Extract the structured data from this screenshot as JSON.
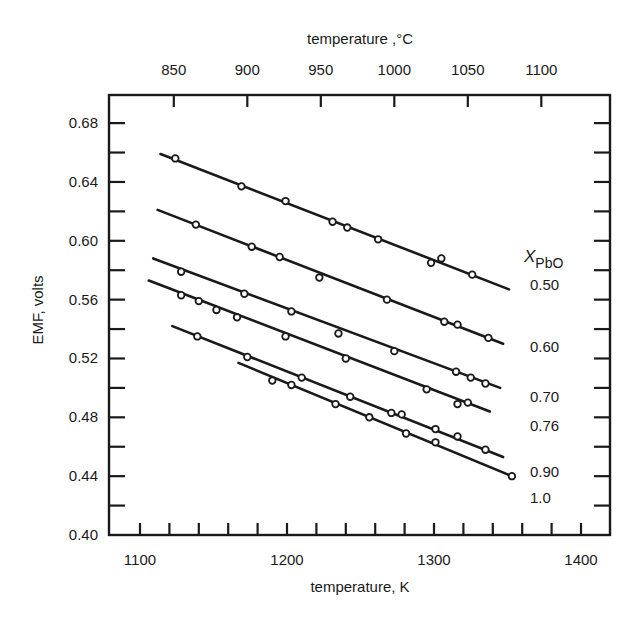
{
  "chart_data": {
    "type": "line",
    "title": "",
    "xlabel": "temperature, K",
    "x2label": "temperature ,°C",
    "ylabel": "EMF, volts",
    "xlim": [
      1075,
      1415
    ],
    "ylim": [
      0.4,
      0.7
    ],
    "x_ticks": [
      1100,
      1200,
      1300,
      1400
    ],
    "x_minor_step": 20,
    "x2_ticks": [
      850,
      900,
      950,
      1000,
      1050,
      1100
    ],
    "y_ticks": [
      0.4,
      0.44,
      0.48,
      0.52,
      0.56,
      0.6,
      0.64,
      0.68
    ],
    "y_minor_step": 0.02,
    "grid": false,
    "legend_title": "X",
    "legend_title_sub": "PbO",
    "legend_position": "right, labels next to line ends",
    "series": [
      {
        "name": "0.50",
        "label_y": 0.57,
        "fit": [
          [
            1114,
            0.659
          ],
          [
            1351,
            0.567
          ]
        ],
        "points": [
          [
            1124,
            0.656
          ],
          [
            1169,
            0.637
          ],
          [
            1199,
            0.627
          ],
          [
            1231,
            0.613
          ],
          [
            1241,
            0.609
          ],
          [
            1262,
            0.601
          ],
          [
            1298,
            0.585
          ],
          [
            1305,
            0.588
          ],
          [
            1326,
            0.577
          ]
        ]
      },
      {
        "name": "0.60",
        "label_y": 0.528,
        "fit": [
          [
            1112,
            0.621
          ],
          [
            1347,
            0.53
          ]
        ],
        "points": [
          [
            1138,
            0.611
          ],
          [
            1176,
            0.596
          ],
          [
            1195,
            0.589
          ],
          [
            1222,
            0.575
          ],
          [
            1268,
            0.56
          ],
          [
            1307,
            0.545
          ],
          [
            1316,
            0.543
          ],
          [
            1337,
            0.534
          ]
        ]
      },
      {
        "name": "0.70",
        "label_y": 0.494,
        "fit": [
          [
            1109,
            0.588
          ],
          [
            1345,
            0.5
          ]
        ],
        "points": [
          [
            1128,
            0.579
          ],
          [
            1171,
            0.564
          ],
          [
            1203,
            0.552
          ],
          [
            1235,
            0.537
          ],
          [
            1273,
            0.525
          ],
          [
            1315,
            0.511
          ],
          [
            1325,
            0.507
          ],
          [
            1335,
            0.503
          ]
        ]
      },
      {
        "name": "0.76",
        "label_y": 0.474,
        "fit": [
          [
            1106,
            0.573
          ],
          [
            1338,
            0.484
          ]
        ],
        "points": [
          [
            1128,
            0.563
          ],
          [
            1140,
            0.559
          ],
          [
            1152,
            0.553
          ],
          [
            1166,
            0.548
          ],
          [
            1199,
            0.535
          ],
          [
            1240,
            0.52
          ],
          [
            1295,
            0.499
          ],
          [
            1316,
            0.489
          ],
          [
            1323,
            0.49
          ]
        ]
      },
      {
        "name": "0.90",
        "label_y": 0.443,
        "fit": [
          [
            1122,
            0.542
          ],
          [
            1347,
            0.453
          ]
        ],
        "points": [
          [
            1139,
            0.535
          ],
          [
            1173,
            0.521
          ],
          [
            1210,
            0.507
          ],
          [
            1243,
            0.494
          ],
          [
            1271,
            0.483
          ],
          [
            1278,
            0.482
          ],
          [
            1301,
            0.472
          ],
          [
            1316,
            0.467
          ],
          [
            1335,
            0.458
          ]
        ]
      },
      {
        "name": "1.0",
        "label_y": 0.425,
        "fit": [
          [
            1167,
            0.517
          ],
          [
            1353,
            0.44
          ]
        ],
        "points": [
          [
            1190,
            0.505
          ],
          [
            1203,
            0.502
          ],
          [
            1233,
            0.489
          ],
          [
            1256,
            0.48
          ],
          [
            1281,
            0.469
          ],
          [
            1301,
            0.463
          ],
          [
            1353,
            0.44
          ]
        ]
      }
    ]
  }
}
